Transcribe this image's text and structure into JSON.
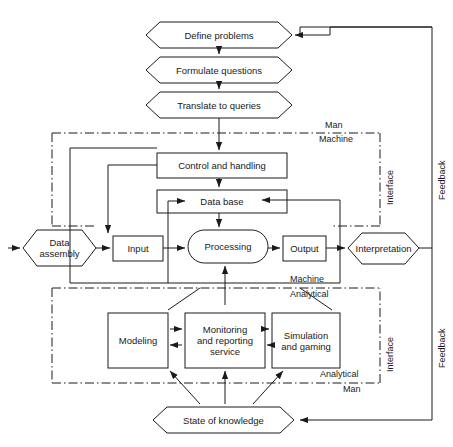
{
  "diagram": {
    "stroke_color": "#1a1a1a",
    "background_color": "#ffffff",
    "nodes": [
      {
        "id": "define_problems",
        "label": "Define problems",
        "shape": "hexagon"
      },
      {
        "id": "formulate",
        "label": "Formulate questions",
        "shape": "hexagon"
      },
      {
        "id": "translate",
        "label": "Translate to queries",
        "shape": "hexagon"
      },
      {
        "id": "control",
        "label": "Control and handling",
        "shape": "rect"
      },
      {
        "id": "database",
        "label": "Data base",
        "shape": "rect"
      },
      {
        "id": "data_assembly",
        "label": "Data\nassembly",
        "shape": "hexagon"
      },
      {
        "id": "input",
        "label": "Input",
        "shape": "rect"
      },
      {
        "id": "processing",
        "label": "Processing",
        "shape": "stadium"
      },
      {
        "id": "output",
        "label": "Output",
        "shape": "rect"
      },
      {
        "id": "interpretation",
        "label": "Interpretation",
        "shape": "hexagon"
      },
      {
        "id": "modeling",
        "label": "Modeling",
        "shape": "rect"
      },
      {
        "id": "monitoring",
        "label": "Monitoring\nand reporting\nservice",
        "shape": "rect"
      },
      {
        "id": "simulation",
        "label": "Simulation\nand gaming",
        "shape": "rect"
      },
      {
        "id": "state_knowledge",
        "label": "State of knowledge",
        "shape": "hexagon"
      }
    ],
    "boundary_labels": [
      {
        "id": "man_machine_top",
        "above": "Man",
        "below": "Machine"
      },
      {
        "id": "machine_analytical_mid",
        "above": "Machine",
        "below": "Analytical"
      },
      {
        "id": "analytical_man_bottom",
        "above": "Analytical",
        "below": "Man"
      }
    ],
    "vertical_labels": [
      {
        "id": "interface_top",
        "label": "Interface"
      },
      {
        "id": "feedback_top",
        "label": "Feedback"
      },
      {
        "id": "interface_bottom",
        "label": "Interface"
      },
      {
        "id": "feedback_bottom",
        "label": "Feedback"
      }
    ]
  }
}
